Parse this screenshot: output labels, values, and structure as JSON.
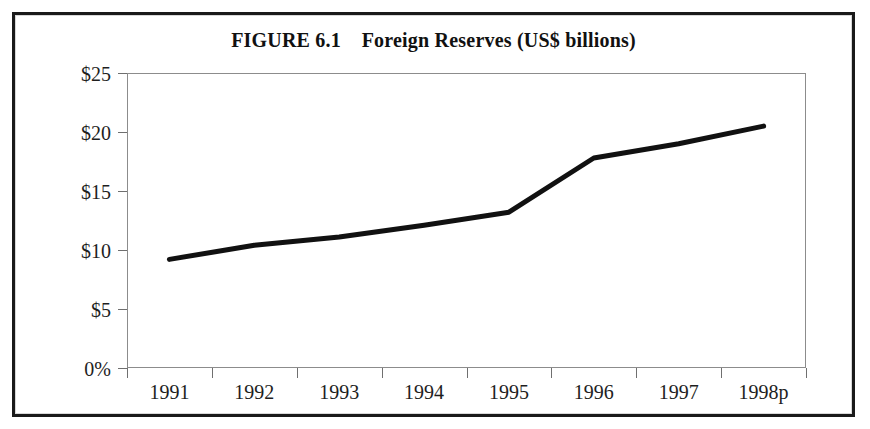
{
  "figure": {
    "title": "FIGURE 6.1    Foreign Reserves (US$ billions)",
    "frame_color": "#1a1a1a",
    "background": "#ffffff"
  },
  "chart_data": {
    "type": "line",
    "title": "FIGURE 6.1    Foreign Reserves (US$ billions)",
    "subtitle": "",
    "xlabel": "",
    "ylabel": "",
    "categories": [
      "1991",
      "1992",
      "1993",
      "1994",
      "1995",
      "1996",
      "1997",
      "1998p"
    ],
    "values": [
      9.2,
      10.4,
      11.1,
      12.1,
      13.2,
      17.8,
      19.0,
      20.5
    ],
    "series": [
      {
        "name": "Foreign Reserves (US$ billions)",
        "values": [
          9.2,
          10.4,
          11.1,
          12.1,
          13.2,
          17.8,
          19.0,
          20.5
        ],
        "color": "#111111",
        "line_width": 5
      }
    ],
    "ylim": [
      0,
      25
    ],
    "yticks": [
      0,
      5,
      10,
      15,
      20,
      25
    ],
    "ytick_labels": [
      "0%",
      "$5",
      "$10",
      "$15",
      "$20",
      "$25"
    ],
    "xtick_labels": [
      "1991",
      "1992",
      "1993",
      "1994",
      "1995",
      "1996",
      "1997",
      "1998p"
    ],
    "grid": false,
    "legend": false,
    "legend_position": "none",
    "units": "US$ billions",
    "annotations": []
  },
  "axes": {
    "y_ticks": [
      {
        "label": "$25",
        "value": 25
      },
      {
        "label": "$20",
        "value": 20
      },
      {
        "label": "$15",
        "value": 15
      },
      {
        "label": "$10",
        "value": 10
      },
      {
        "label": "$5",
        "value": 5
      },
      {
        "label": "0%",
        "value": 0
      }
    ],
    "x_ticks": [
      {
        "label": "1991"
      },
      {
        "label": "1992"
      },
      {
        "label": "1993"
      },
      {
        "label": "1994"
      },
      {
        "label": "1995"
      },
      {
        "label": "1996"
      },
      {
        "label": "1997"
      },
      {
        "label": "1998p"
      }
    ]
  }
}
